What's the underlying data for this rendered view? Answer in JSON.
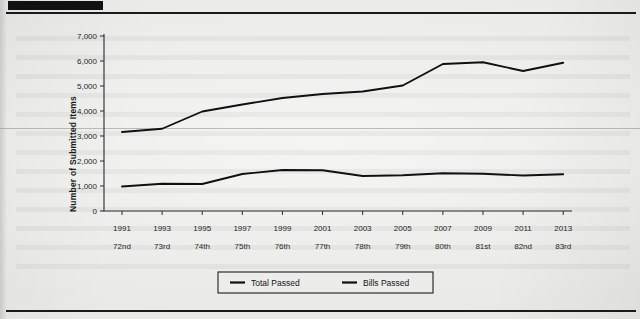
{
  "document": {
    "redaction_bar": "",
    "background_color": "#e9e9e7",
    "rule_color": "#1a1a1a"
  },
  "chart_data": {
    "type": "line",
    "title": "",
    "xlabel": "",
    "ylabel": "Number of Submitted Items",
    "ylim": [
      0,
      7000
    ],
    "ytick_step": 1000,
    "ytick_labels": [
      "0",
      "1,000",
      "2,000",
      "3,000",
      "4,000",
      "5,000",
      "6,000",
      "7,000"
    ],
    "ytick_values": [
      0,
      1000,
      2000,
      3000,
      4000,
      5000,
      6000,
      7000
    ],
    "grid": false,
    "legend_position": "bottom",
    "categories": [
      "1991",
      "1993",
      "1995",
      "1997",
      "1999",
      "2001",
      "2003",
      "2005",
      "2007",
      "2009",
      "2011",
      "2013"
    ],
    "categories_secondary": [
      "72nd",
      "73rd",
      "74th",
      "75th",
      "76th",
      "77th",
      "78th",
      "79th",
      "80th",
      "81st",
      "82nd",
      "83rd"
    ],
    "series": [
      {
        "name": "Total Passed",
        "color": "#101010",
        "values": [
          3160,
          3290,
          3980,
          4260,
          4520,
          4680,
          4780,
          5020,
          5880,
          5950,
          5600,
          5930
        ]
      },
      {
        "name": "Bills Passed",
        "color": "#101010",
        "values": [
          980,
          1090,
          1080,
          1480,
          1640,
          1630,
          1400,
          1430,
          1510,
          1490,
          1420,
          1470
        ]
      }
    ]
  },
  "legend": {
    "entries": [
      {
        "label": "Total Passed"
      },
      {
        "label": "Bills Passed"
      }
    ]
  }
}
